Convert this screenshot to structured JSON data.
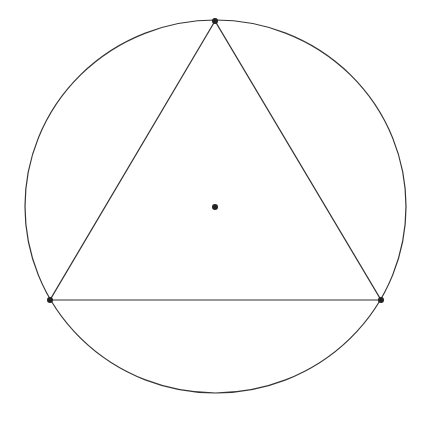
{
  "diagram": {
    "title": "",
    "background": "#ffffff",
    "stroke_color": "#333333",
    "point_color": "#222222",
    "circumcircle": {
      "cx": 215.5,
      "cy": 206.5,
      "rx": 190.5,
      "ry": 186.5
    },
    "triangle": {
      "vertices": [
        {
          "name": "top",
          "x": 215,
          "y": 21
        },
        {
          "name": "bottom-left",
          "x": 50,
          "y": 300
        },
        {
          "name": "bottom-right",
          "x": 381,
          "y": 300
        }
      ]
    },
    "center_point": {
      "x": 215,
      "y": 207
    },
    "point_radius": 3
  }
}
